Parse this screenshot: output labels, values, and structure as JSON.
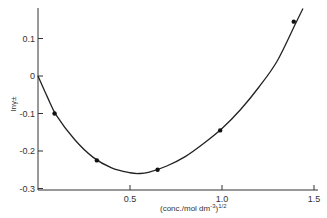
{
  "chart_data": {
    "type": "line",
    "title": "",
    "xlabel": "(conc./mol dm^-3)^1/2",
    "ylabel": "ln γ±",
    "xlim": [
      0,
      1.5
    ],
    "ylim": [
      -0.3,
      0.18
    ],
    "x_ticks": [
      0.5,
      1.0,
      1.5
    ],
    "x_tick_labels": [
      "0.5",
      "1.0",
      "1.5"
    ],
    "y_ticks": [
      0.1,
      0,
      -0.1,
      -0.2,
      -0.3
    ],
    "y_tick_labels": [
      "0.1",
      "0",
      "-0.1",
      "-0.2",
      "-0.3"
    ],
    "grid": false,
    "legend": null,
    "series": [
      {
        "name": "measured points",
        "style": "markers",
        "x": [
          0.09,
          0.32,
          0.65,
          0.99,
          1.39
        ],
        "y": [
          -0.1,
          -0.225,
          -0.25,
          -0.145,
          0.145
        ]
      },
      {
        "name": "fitted curve",
        "style": "line",
        "x": [
          0,
          0.05,
          0.1,
          0.2,
          0.3,
          0.4,
          0.5,
          0.55,
          0.6,
          0.7,
          0.8,
          0.9,
          1.0,
          1.1,
          1.2,
          1.3,
          1.4,
          1.44
        ],
        "y": [
          0,
          -0.055,
          -0.105,
          -0.17,
          -0.217,
          -0.245,
          -0.258,
          -0.26,
          -0.257,
          -0.24,
          -0.215,
          -0.18,
          -0.14,
          -0.09,
          -0.03,
          0.04,
          0.14,
          0.18
        ]
      }
    ]
  },
  "labels": {
    "x_axis_title_main": "(conc./mol dm",
    "x_axis_title_sup1": "-3",
    "x_axis_title_close": ")",
    "x_axis_title_sup2": "1/2",
    "y_axis_title": "lnγ±"
  }
}
